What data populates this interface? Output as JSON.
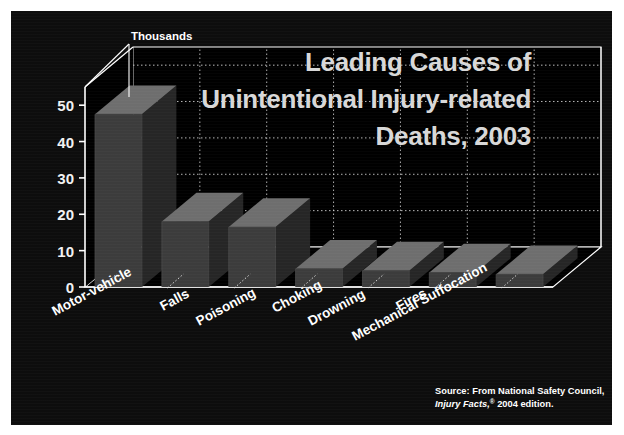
{
  "figure": {
    "title_lines": [
      "Leading Causes of",
      "Unintentional Injury-related",
      "Deaths, 2003"
    ],
    "unit_label": "Thousands",
    "source_line1": "Source: From National Safety Council,",
    "source_italic": "Injury Facts,",
    "source_mark": "®",
    "source_line2_rest": " 2004 edition.",
    "background_color": "#0d0d0d",
    "bar_front_color": "#3c3c3c",
    "bar_top_color": "#6e6e6e",
    "bar_side_color": "#262626",
    "grid_color": "#d9d9d9",
    "axis_color": "#ffffff",
    "title_color": "#d8d8d8"
  },
  "chart_data": {
    "type": "bar",
    "xlabel": "",
    "ylabel": "Thousands",
    "ylim": [
      0,
      55
    ],
    "yticks": [
      0,
      10,
      20,
      30,
      40,
      50
    ],
    "ytick_labels": [
      "0",
      "10",
      "20",
      "30",
      "40",
      "50"
    ],
    "grid": true,
    "legend": "none",
    "units": "thousands of deaths",
    "categories": [
      "Motor-vehicle",
      "Falls",
      "Poisoning",
      "Choking",
      "Drowning",
      "Fires",
      "Mechanical Suffocation"
    ],
    "values": [
      47.5,
      18.0,
      16.5,
      5.0,
      4.5,
      4.0,
      3.5
    ],
    "series": [
      {
        "name": "Unintentional injury deaths",
        "values": [
          47.5,
          18.0,
          16.5,
          5.0,
          4.5,
          4.0,
          3.5
        ]
      }
    ],
    "annotations": [
      "Thousands"
    ],
    "source": "From National Safety Council, Injury Facts,® 2004 edition."
  }
}
